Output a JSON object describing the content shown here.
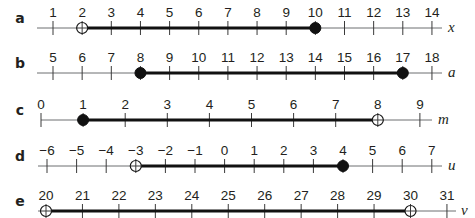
{
  "number_lines": [
    {
      "part": "a",
      "variable": "x",
      "ticks": [
        1,
        2,
        3,
        4,
        5,
        6,
        7,
        8,
        9,
        10,
        11,
        12,
        13,
        14
      ],
      "tick_labels": [
        "1",
        "2",
        "3",
        "4",
        "5",
        "6",
        "7",
        "8",
        "9",
        "10",
        "11",
        "12",
        "13",
        "14"
      ],
      "interval": {
        "start": 2,
        "end": 10,
        "start_type": "open",
        "end_type": "closed"
      },
      "layout": {
        "y": 28,
        "label_x": 20,
        "first_x": 53,
        "spacing": 29.15,
        "axis_start": 37,
        "axis_end": 442,
        "var_x": 448
      }
    },
    {
      "part": "b",
      "variable": "a",
      "ticks": [
        5,
        6,
        7,
        8,
        9,
        10,
        11,
        12,
        13,
        14,
        15,
        16,
        17,
        18
      ],
      "tick_labels": [
        "5",
        "6",
        "7",
        "8",
        "9",
        "10",
        "11",
        "12",
        "13",
        "14",
        "15",
        "16",
        "17",
        "18"
      ],
      "interval": {
        "start": 8,
        "end": 17,
        "start_type": "closed",
        "end_type": "closed"
      },
      "layout": {
        "y": 73,
        "label_x": 20,
        "first_x": 53,
        "spacing": 29.15,
        "axis_start": 37,
        "axis_end": 442,
        "var_x": 448
      }
    },
    {
      "part": "c",
      "variable": "m",
      "ticks": [
        0,
        1,
        2,
        3,
        4,
        5,
        6,
        7,
        8,
        9
      ],
      "tick_labels": [
        "0",
        "1",
        "2",
        "3",
        "4",
        "5",
        "6",
        "7",
        "8",
        "9"
      ],
      "interval": {
        "start": 1,
        "end": 8,
        "start_type": "closed",
        "end_type": "open"
      },
      "layout": {
        "y": 120,
        "label_x": 20,
        "first_x": 41,
        "spacing": 42.1,
        "axis_start": 41,
        "axis_end": 432,
        "var_x": 438
      }
    },
    {
      "part": "d",
      "variable": "u",
      "ticks": [
        -6,
        -5,
        -4,
        -3,
        -2,
        -1,
        0,
        1,
        2,
        3,
        4,
        5,
        6,
        7
      ],
      "tick_labels": [
        "−6",
        "−5",
        "−4",
        "−3",
        "−2",
        "−1",
        "0",
        "1",
        "2",
        "3",
        "4",
        "5",
        "6",
        "7"
      ],
      "interval": {
        "start": -3,
        "end": 4,
        "start_type": "open",
        "end_type": "closed"
      },
      "layout": {
        "y": 166,
        "label_x": 20,
        "first_x": 47,
        "spacing": 29.6,
        "axis_start": 38,
        "axis_end": 442,
        "var_x": 448
      }
    },
    {
      "part": "e",
      "variable": "v",
      "ticks": [
        20,
        21,
        22,
        23,
        24,
        25,
        26,
        27,
        28,
        29,
        30,
        31
      ],
      "tick_labels": [
        "20",
        "21",
        "22",
        "23",
        "24",
        "25",
        "26",
        "27",
        "28",
        "29",
        "30",
        "31"
      ],
      "interval": {
        "start": 20,
        "end": 30,
        "start_type": "open",
        "end_type": "open"
      },
      "layout": {
        "y": 211,
        "label_x": 20,
        "first_x": 46,
        "spacing": 36.45,
        "axis_start": 38,
        "axis_end": 456,
        "var_x": 461
      }
    }
  ]
}
